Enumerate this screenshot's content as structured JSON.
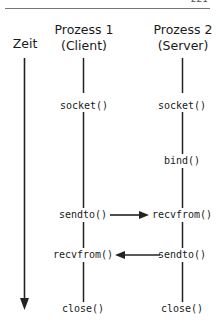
{
  "page": {
    "number": "221"
  },
  "diagram": {
    "time_axis_label": "Zeit",
    "process1": {
      "title": "Prozess 1",
      "subtitle": "(Client)"
    },
    "process2": {
      "title": "Prozess 2",
      "subtitle": "(Server)"
    },
    "client_calls": [
      "socket()",
      "sendto()",
      "recvfrom()",
      "close()"
    ],
    "server_calls": [
      "socket()",
      "bind()",
      "recvfrom()",
      "sendto()",
      "close()"
    ],
    "messages": [
      {
        "from": "sendto()",
        "to": "recvfrom()",
        "direction": "client-to-server"
      },
      {
        "from": "sendto()",
        "to": "recvfrom()",
        "direction": "server-to-client"
      }
    ]
  }
}
